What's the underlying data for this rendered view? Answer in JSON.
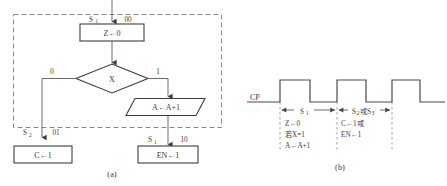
{
  "figure": {
    "caption_a": "(a)",
    "caption_b": "(b)"
  },
  "flowchart": {
    "state_top_label": "S",
    "state_top_sub": "1",
    "state_top_code": "00",
    "process_z": "Z←0",
    "decision": "X",
    "branch_false": "0",
    "branch_true": "1",
    "io_increment": "A←A+1",
    "state_left_label": "S",
    "state_left_sub": "2",
    "state_left_code": "01",
    "process_c": "C←1",
    "state_right_label": "S",
    "state_right_sub": "1",
    "state_right_code": "10",
    "process_en": "EN←1"
  },
  "timing": {
    "clock_label": "CP",
    "interval_1": {
      "span_label": "S",
      "span_sub": "1",
      "lines": [
        "Z←0",
        "若X=1",
        "A←A+1"
      ]
    },
    "interval_2": {
      "span_label_a": "S",
      "span_sub_a": "2",
      "span_conj": "或",
      "span_label_b": "S",
      "span_sub_b": "3",
      "lines": [
        "C←1或",
        "EN←1"
      ]
    }
  },
  "colors": {
    "line": "#4a4a4a",
    "dash": "#7d7d7d",
    "text": "#3a3a3a",
    "background": "#ffffff"
  }
}
